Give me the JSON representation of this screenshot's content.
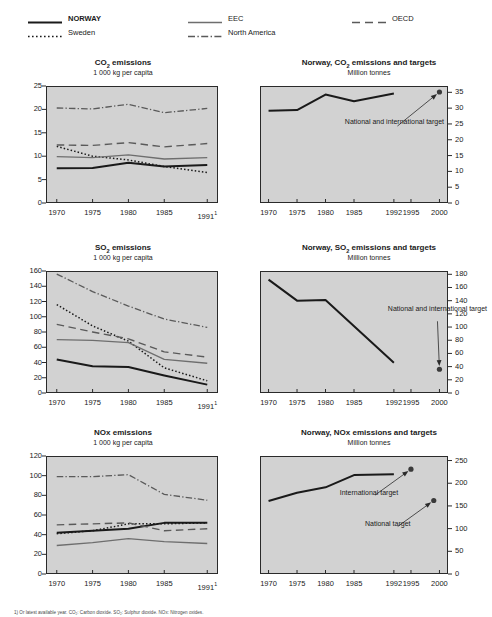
{
  "legend": {
    "items": [
      {
        "label": "NORWAY",
        "style": "solid-thick-black",
        "bold": true,
        "col": 0,
        "row": 0
      },
      {
        "label": "Sweden",
        "style": "dotted-black",
        "bold": false,
        "col": 0,
        "row": 1
      },
      {
        "label": "EEC",
        "style": "solid-thin-gray",
        "bold": false,
        "col": 1,
        "row": 0
      },
      {
        "label": "North America",
        "style": "dash-dot-gray",
        "bold": false,
        "col": 1,
        "row": 1
      },
      {
        "label": "OECD",
        "style": "long-dash-gray",
        "bold": false,
        "col": 2,
        "row": 0
      }
    ]
  },
  "footnote": "1) Or latest available year. CO₂: Carbon dioxide. SO₂: Sulphur dioxide. NOx: Nitrogen oxides.",
  "colors": {
    "plot_background": "#d2d2d2",
    "axis": "#2a2a2a",
    "norway": "#1a1a1a",
    "sweden": "#1a1a1a",
    "eec": "#6e6e6e",
    "north_america": "#5a5a5a",
    "oecd": "#5a5a5a"
  },
  "chart_data": [
    {
      "id": "co2-per-capita",
      "type": "line",
      "title": "CO2 emissions",
      "title_parts": {
        "pre": "CO",
        "sub": "2",
        "post": " emissions"
      },
      "subtitle": "1 000 kg per capita",
      "xlabel": "",
      "ylabel": "",
      "x": [
        1970,
        1975,
        1980,
        1985,
        1991
      ],
      "xticklabels": [
        "1970",
        "1975",
        "1980",
        "1985",
        "1991"
      ],
      "xtick_superscript_last": "1",
      "xlim": [
        1968.5,
        1992.5
      ],
      "ylim": [
        0,
        25
      ],
      "yticks": [
        0,
        5,
        10,
        15,
        20,
        25
      ],
      "yticklabels": [
        "0",
        "5",
        "10",
        "15",
        "20",
        "25"
      ],
      "grid": false,
      "legend_position": "top-external",
      "series": [
        {
          "name": "NORWAY",
          "style": "solid-thick-black",
          "values": [
            7.4,
            7.5,
            8.6,
            7.8,
            8.1
          ]
        },
        {
          "name": "Sweden",
          "style": "dotted-black",
          "values": [
            12.1,
            10.0,
            9.2,
            7.8,
            6.5
          ]
        },
        {
          "name": "EEC",
          "style": "solid-thin-gray",
          "values": [
            9.9,
            9.7,
            10.3,
            9.4,
            9.7
          ]
        },
        {
          "name": "North America",
          "style": "dash-dot-gray",
          "values": [
            20.3,
            20.1,
            21.1,
            19.3,
            20.2
          ]
        },
        {
          "name": "OECD",
          "style": "long-dash-gray",
          "values": [
            12.4,
            12.3,
            12.9,
            12.0,
            12.7
          ]
        }
      ]
    },
    {
      "id": "norway-co2-targets",
      "type": "line",
      "title": "Norway, CO2 emissions and targets",
      "title_parts": {
        "pre": "Norway, CO",
        "sub": "2",
        "post": " emissions and targets"
      },
      "subtitle": "Million tonnes",
      "xlabel": "",
      "ylabel": "",
      "xticklabels": [
        "1970",
        "1975",
        "1980",
        "1985",
        "1992",
        "1995",
        "2000"
      ],
      "xtickvalues": [
        1970,
        1975,
        1980,
        1985,
        1992,
        1995,
        2000
      ],
      "xlim": [
        1968.5,
        2001.5
      ],
      "ylim": [
        0,
        37
      ],
      "yticks": [
        0,
        5,
        10,
        15,
        20,
        25,
        30,
        35
      ],
      "yticklabels": [
        "0",
        "5",
        "10",
        "15",
        "20",
        "25",
        "30",
        "35"
      ],
      "yaxis_side": "right",
      "grid": false,
      "series": [
        {
          "name": "Norway emissions",
          "style": "solid-thick-black",
          "x": [
            1970,
            1975,
            1980,
            1985,
            1992
          ],
          "values": [
            29.2,
            29.4,
            34.3,
            32.2,
            34.6
          ]
        }
      ],
      "markers": [
        {
          "label": "National and international target",
          "x": 2000,
          "y": 35.1,
          "annotation": "National and international target"
        }
      ]
    },
    {
      "id": "so2-per-capita",
      "type": "line",
      "title": "SO2 emissions",
      "title_parts": {
        "pre": "SO",
        "sub": "2",
        "post": " emissions"
      },
      "subtitle": "1 000 kg per capita",
      "xlabel": "",
      "ylabel": "",
      "x": [
        1970,
        1975,
        1980,
        1985,
        1991
      ],
      "xticklabels": [
        "1970",
        "1975",
        "1980",
        "1985",
        "1991"
      ],
      "xtick_superscript_last": "1",
      "xlim": [
        1968.5,
        1992.5
      ],
      "ylim": [
        0,
        160
      ],
      "yticks": [
        0,
        20,
        40,
        60,
        80,
        100,
        120,
        140,
        160
      ],
      "yticklabels": [
        "0",
        "20",
        "40",
        "60",
        "80",
        "100",
        "120",
        "140",
        "160"
      ],
      "grid": false,
      "series": [
        {
          "name": "NORWAY",
          "style": "solid-thick-black",
          "values": [
            44,
            35,
            34,
            23,
            11
          ]
        },
        {
          "name": "Sweden",
          "style": "dotted-black",
          "values": [
            116,
            88,
            68,
            33,
            16
          ]
        },
        {
          "name": "EEC",
          "style": "solid-thin-gray",
          "values": [
            70,
            69,
            66,
            44,
            39
          ]
        },
        {
          "name": "North America",
          "style": "dash-dot-gray",
          "values": [
            156,
            133,
            114,
            97,
            86
          ]
        },
        {
          "name": "OECD",
          "style": "long-dash-gray",
          "values": [
            90,
            80,
            71,
            54,
            47
          ]
        }
      ]
    },
    {
      "id": "norway-so2-targets",
      "type": "line",
      "title": "Norway, SO2 emissions and targets",
      "title_parts": {
        "pre": "Norway, SO",
        "sub": "2",
        "post": " emissions and targets"
      },
      "subtitle": "Million tonnes",
      "xlabel": "",
      "ylabel": "",
      "xticklabels": [
        "1970",
        "1975",
        "1980",
        "1985",
        "1992",
        "1995",
        "2000"
      ],
      "xtickvalues": [
        1970,
        1975,
        1980,
        1985,
        1992,
        1995,
        2000
      ],
      "xlim": [
        1968.5,
        2001.5
      ],
      "ylim": [
        0,
        185
      ],
      "yticks": [
        0,
        20,
        40,
        60,
        80,
        100,
        120,
        140,
        160,
        180
      ],
      "yticklabels": [
        "0",
        "20",
        "40",
        "60",
        "80",
        "100",
        "120",
        "140",
        "160",
        "180"
      ],
      "yaxis_side": "right",
      "grid": false,
      "series": [
        {
          "name": "Norway emissions",
          "style": "solid-thick-black",
          "x": [
            1970,
            1975,
            1980,
            1992
          ],
          "values": [
            172,
            140,
            141,
            46
          ]
        }
      ],
      "markers": [
        {
          "label": "National and international target",
          "x": 2000,
          "y": 36,
          "annotation": "National and international target"
        }
      ]
    },
    {
      "id": "nox-per-capita",
      "type": "line",
      "title": "NOx emissions",
      "title_parts": {
        "pre": "NOx emissions",
        "sub": "",
        "post": ""
      },
      "subtitle": "1 000 kg per capita",
      "xlabel": "",
      "ylabel": "",
      "x": [
        1970,
        1975,
        1980,
        1985,
        1991
      ],
      "xticklabels": [
        "1970",
        "1975",
        "1980",
        "1985",
        "1991"
      ],
      "xtick_superscript_last": "1",
      "xlim": [
        1968.5,
        1992.5
      ],
      "ylim": [
        0,
        120
      ],
      "yticks": [
        0,
        20,
        40,
        60,
        80,
        100,
        120
      ],
      "yticklabels": [
        "0",
        "20",
        "40",
        "60",
        "80",
        "100",
        "120"
      ],
      "grid": false,
      "series": [
        {
          "name": "NORWAY",
          "style": "solid-thick-black",
          "values": [
            42,
            44,
            46,
            52,
            52
          ]
        },
        {
          "name": "Sweden",
          "style": "dotted-black",
          "values": [
            41,
            44,
            51,
            51,
            52
          ]
        },
        {
          "name": "EEC",
          "style": "solid-thin-gray",
          "values": [
            29,
            32,
            36,
            33,
            31
          ]
        },
        {
          "name": "North America",
          "style": "dash-dot-gray",
          "values": [
            99,
            99,
            101,
            81,
            75
          ]
        },
        {
          "name": "OECD",
          "style": "long-dash-gray",
          "values": [
            50,
            51,
            52,
            44,
            46
          ]
        }
      ]
    },
    {
      "id": "norway-nox-targets",
      "type": "line",
      "title": "Norway, NOx emissions and targets",
      "title_parts": {
        "pre": "Norway, NOx emissions and targets",
        "sub": "",
        "post": ""
      },
      "subtitle": "Million tonnes",
      "xlabel": "",
      "ylabel": "",
      "xticklabels": [
        "1970",
        "1975",
        "1980",
        "1985",
        "1992",
        "1995",
        "2000"
      ],
      "xtickvalues": [
        1970,
        1975,
        1980,
        1985,
        1992,
        1995,
        2000
      ],
      "xlim": [
        1968.5,
        2001.5
      ],
      "ylim": [
        0,
        260
      ],
      "yticks": [
        0,
        50,
        100,
        150,
        200,
        250
      ],
      "yticklabels": [
        "0",
        "50",
        "100",
        "150",
        "200",
        "250"
      ],
      "yaxis_side": "right",
      "grid": false,
      "series": [
        {
          "name": "Norway emissions",
          "style": "solid-thick-black",
          "x": [
            1970,
            1975,
            1980,
            1985,
            1992
          ],
          "values": [
            161,
            179,
            191,
            218,
            220
          ]
        }
      ],
      "markers": [
        {
          "label": "International target",
          "x": 1995,
          "y": 231,
          "annotation": "International target"
        },
        {
          "label": "National target",
          "x": 1999,
          "y": 162,
          "annotation": "National target"
        }
      ]
    }
  ]
}
